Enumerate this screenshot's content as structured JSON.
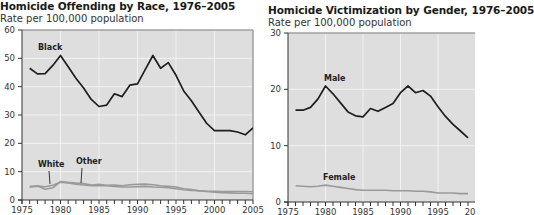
{
  "charts": {
    "left": {
      "title": "Homicide Offending by Race, 1976–2005",
      "subtitle": "Rate per 100,000 population"
    },
    "right": {
      "title": "Homicide Victimization by Gender, 1976–2005",
      "subtitle": "Rate per 100,000 population"
    }
  },
  "colors": {
    "plot_bg": "#dedede",
    "grid": "#f2f2f2",
    "dark_line": "#1e1e1e",
    "light_line": "#9a9a9a",
    "axis": "#333333"
  },
  "chart_data": [
    {
      "type": "line",
      "title": "Homicide Offending by Race, 1976–2005",
      "subtitle": "Rate per 100,000 population",
      "xlabel": "",
      "ylabel": "Rate per 100,000 population",
      "xlim": [
        1975,
        2005
      ],
      "ylim": [
        0,
        60
      ],
      "x_ticks": [
        1975,
        1980,
        1985,
        1990,
        1995,
        2000,
        2005
      ],
      "y_ticks": [
        0,
        10,
        20,
        30,
        40,
        50,
        60
      ],
      "grid": true,
      "legend": "inline labels",
      "x": [
        1976,
        1977,
        1978,
        1979,
        1980,
        1981,
        1982,
        1983,
        1984,
        1985,
        1986,
        1987,
        1988,
        1989,
        1990,
        1991,
        1992,
        1993,
        1994,
        1995,
        1996,
        1997,
        1998,
        1999,
        2000,
        2001,
        2002,
        2003,
        2004,
        2005
      ],
      "series": [
        {
          "name": "Black",
          "values": [
            46.5,
            44.5,
            44.6,
            47.5,
            51.0,
            47.0,
            43.0,
            39.5,
            35.5,
            33.0,
            33.5,
            37.5,
            36.5,
            40.5,
            41.0,
            46.0,
            51.0,
            46.5,
            48.5,
            44.0,
            38.5,
            35.0,
            31.0,
            27.0,
            24.5,
            24.5,
            24.5,
            24.0,
            23.0,
            25.5
          ]
        },
        {
          "name": "White",
          "values": [
            4.8,
            4.9,
            4.7,
            5.2,
            6.3,
            6.0,
            5.6,
            5.3,
            5.0,
            5.0,
            5.0,
            4.8,
            4.6,
            4.6,
            4.7,
            4.8,
            4.6,
            4.5,
            4.3,
            4.0,
            3.6,
            3.4,
            3.3,
            3.1,
            3.1,
            3.0,
            3.0,
            3.0,
            3.0,
            2.9
          ]
        },
        {
          "name": "Other",
          "values": [
            4.5,
            5.0,
            3.8,
            4.3,
            6.5,
            6.2,
            6.0,
            5.8,
            5.3,
            5.5,
            5.2,
            5.3,
            5.0,
            5.4,
            5.5,
            5.6,
            5.4,
            5.0,
            4.8,
            4.6,
            4.0,
            3.7,
            3.2,
            3.0,
            2.8,
            2.6,
            2.5,
            2.4,
            2.4,
            2.2
          ]
        }
      ],
      "annotations": [
        "Black",
        "White",
        "Other"
      ]
    },
    {
      "type": "line",
      "title": "Homicide Victimization by Gender, 1976–2005",
      "subtitle": "Rate per 100,000 population",
      "xlabel": "",
      "ylabel": "Rate per 100,000 population",
      "xlim": [
        1975,
        2005
      ],
      "ylim": [
        0,
        30
      ],
      "x_ticks": [
        1975,
        1980,
        1985,
        1990,
        1995,
        2000
      ],
      "y_ticks": [
        0,
        10,
        20,
        30
      ],
      "grid": true,
      "legend": "inline labels",
      "x": [
        1976,
        1977,
        1978,
        1979,
        1980,
        1981,
        1982,
        1983,
        1984,
        1985,
        1986,
        1987,
        1988,
        1989,
        1990,
        1991,
        1992,
        1993,
        1994,
        1995,
        1996,
        1997,
        1998,
        1999
      ],
      "series": [
        {
          "name": "Male",
          "values": [
            16.3,
            16.3,
            16.8,
            18.3,
            20.6,
            19.2,
            17.6,
            16.0,
            15.3,
            15.1,
            16.6,
            16.1,
            16.8,
            17.5,
            19.4,
            20.6,
            19.4,
            19.8,
            18.8,
            16.9,
            15.2,
            13.8,
            12.6,
            11.4
          ]
        },
        {
          "name": "Female",
          "values": [
            2.9,
            2.8,
            2.7,
            2.8,
            3.0,
            2.8,
            2.6,
            2.4,
            2.2,
            2.1,
            2.1,
            2.1,
            2.1,
            2.0,
            2.0,
            2.0,
            1.9,
            1.9,
            1.8,
            1.6,
            1.6,
            1.6,
            1.5,
            1.5
          ]
        }
      ],
      "annotations": [
        "Male",
        "Female"
      ]
    }
  ]
}
